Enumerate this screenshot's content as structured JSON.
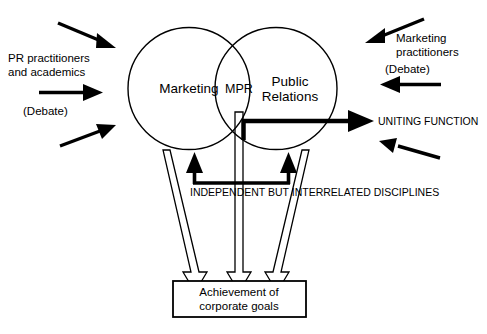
{
  "diagram": {
    "background_color": "#ffffff",
    "stroke_color": "#000000",
    "circles": [
      {
        "id": "marketing",
        "label": "Marketing"
      },
      {
        "id": "public-relations",
        "label_line1": "Public",
        "label_line2": "Relations"
      }
    ],
    "overlap_label": "MPR",
    "left_annotation": {
      "line1": "PR practitioners",
      "line2": "and academics",
      "debate": "(Debate)"
    },
    "right_annotation": {
      "line1": "Marketing",
      "line2": "practitioners",
      "debate": "(Debate)"
    },
    "uniting_function_label": "UNITING FUNCTION",
    "interrelated_label": "INDEPENDENT BUT INTERRELATED DISCIPLINES",
    "outcome_box": {
      "line1": "Achievement of",
      "line2": "corporate goals"
    }
  }
}
